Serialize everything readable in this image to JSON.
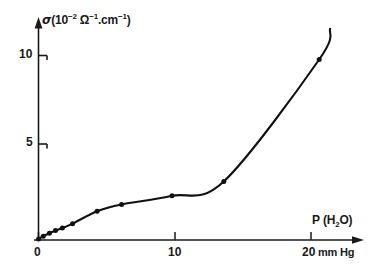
{
  "chart_data": {
    "type": "line",
    "title": "",
    "subtitle": "",
    "xlabel": "P (H2O)",
    "xlabel_display": "P (H₂O)",
    "xunit": "mm Hg",
    "ylabel": "sigma (10^-2 Ohm^-1 cm^-1)",
    "ylabel_display": "σ (10⁻² Ω⁻¹·cm⁻¹)",
    "yunit": "10^-2 Ohm^-1 cm^-1",
    "xlim": [
      0,
      24
    ],
    "ylim": [
      0,
      11.5
    ],
    "xticks": [
      0,
      10,
      20
    ],
    "xtick_labels": [
      "0",
      "10",
      "20"
    ],
    "yticks": [
      5,
      10
    ],
    "ytick_labels": [
      "5",
      "10"
    ],
    "grid": false,
    "legend": false,
    "legend_position": "none",
    "axis_style": "arrow-tipped-half-axes",
    "marker": "filled-circle",
    "line_color": "#111111",
    "marker_color": "#111111",
    "background": "#ffffff",
    "series": [
      {
        "name": "conductivity",
        "x": [
          0.0,
          0.35,
          0.8,
          1.25,
          1.75,
          2.5,
          4.3,
          6.1,
          9.8,
          13.6,
          20.6
        ],
        "y": [
          0.05,
          0.2,
          0.35,
          0.5,
          0.62,
          0.85,
          1.5,
          1.85,
          2.3,
          3.05,
          9.4
        ]
      }
    ],
    "curve_extension": {
      "x_end": 21.4,
      "y_end": 11.0,
      "note": "smooth curve continues past last data point"
    },
    "annotations": []
  },
  "axes": {
    "y_axis_label": "σ (10⁻² Ω⁻¹·cm⁻¹)",
    "y_axis_label_parts": {
      "symbol": "σ",
      "open": "(",
      "base": "10",
      "exp1": "−2",
      "ohm": "Ω",
      "exp2": "−1",
      "dot": ".",
      "cm": "cm",
      "exp3": "−1",
      "close": ")"
    },
    "x_axis_label": "P (H₂O)",
    "x_axis_label_parts": {
      "symbol": "P",
      "open": "(H",
      "sub": "2",
      "close": "O)"
    },
    "x_axis_unit": "mm Hg",
    "ytick_10": "10",
    "ytick_5": "5",
    "xtick_0": "0",
    "xtick_10": "10",
    "xtick_20": "20"
  }
}
